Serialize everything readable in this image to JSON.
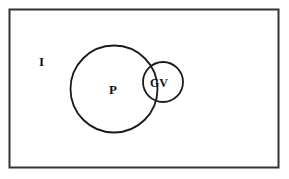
{
  "diagram": {
    "type": "venn",
    "universe": {
      "label": "I"
    },
    "sets": [
      {
        "label": "P"
      },
      {
        "label": "GV"
      }
    ],
    "colors": {
      "stroke": "#1a1a1a",
      "background": "#ffffff"
    }
  }
}
